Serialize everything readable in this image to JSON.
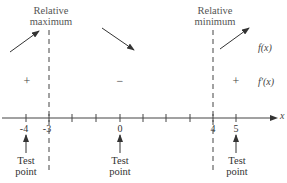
{
  "diagram": {
    "type": "sign-chart",
    "axis": {
      "variable": "x",
      "tick_labels": [
        "-4",
        "-3",
        "0",
        "4",
        "5"
      ]
    },
    "critical_labels": [
      {
        "line1": "Relative",
        "line2": "maximum",
        "at": "-3"
      },
      {
        "line1": "Relative",
        "line2": "minimum",
        "at": "4"
      }
    ],
    "rows": {
      "function_label": "f(x)",
      "derivative_label": "f′(x)"
    },
    "signs": [
      "+",
      "−",
      "+"
    ],
    "behavior": [
      "increasing",
      "decreasing",
      "increasing"
    ],
    "test_points": [
      {
        "at": "-4",
        "line1": "Test",
        "line2": "point"
      },
      {
        "at": "0",
        "line1": "Test",
        "line2": "point"
      },
      {
        "at": "5",
        "line1": "Test",
        "line2": "point"
      }
    ]
  }
}
